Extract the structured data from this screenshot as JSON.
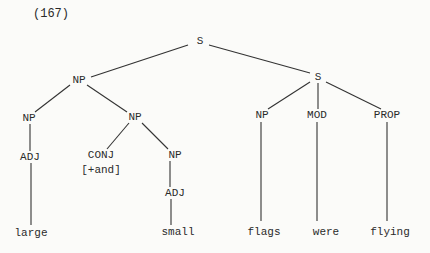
{
  "example_number": "(167)",
  "tree": {
    "nodes": [
      {
        "id": "s_root",
        "label": "S",
        "x": 200,
        "y": 41
      },
      {
        "id": "np_subj",
        "label": "NP",
        "x": 79,
        "y": 80
      },
      {
        "id": "s_pred",
        "label": "S",
        "x": 318,
        "y": 77
      },
      {
        "id": "np_left",
        "label": "NP",
        "x": 29,
        "y": 118
      },
      {
        "id": "np_conj",
        "label": "NP",
        "x": 135,
        "y": 117
      },
      {
        "id": "adj_left",
        "label": "ADJ",
        "x": 30,
        "y": 157
      },
      {
        "id": "conj",
        "label": "CONJ",
        "x": 101,
        "y": 155
      },
      {
        "id": "conj_feature",
        "label": "[+and]",
        "x": 101,
        "y": 170
      },
      {
        "id": "np_inner",
        "label": "NP",
        "x": 175,
        "y": 155
      },
      {
        "id": "adj_inner",
        "label": "ADJ",
        "x": 175,
        "y": 193
      },
      {
        "id": "np_right",
        "label": "NP",
        "x": 262,
        "y": 115
      },
      {
        "id": "mod",
        "label": "MOD",
        "x": 317,
        "y": 115
      },
      {
        "id": "prop",
        "label": "PROP",
        "x": 387,
        "y": 115
      },
      {
        "id": "leaf_large",
        "label": "large",
        "x": 31,
        "y": 233
      },
      {
        "id": "leaf_small",
        "label": "small",
        "x": 178,
        "y": 232
      },
      {
        "id": "leaf_flags",
        "label": "flags",
        "x": 264,
        "y": 232
      },
      {
        "id": "leaf_were",
        "label": "were",
        "x": 326,
        "y": 232
      },
      {
        "id": "leaf_flying",
        "label": "flying",
        "x": 390,
        "y": 232
      }
    ],
    "edges": [
      {
        "x1": 188,
        "y1": 45,
        "x2": 91,
        "y2": 77
      },
      {
        "x1": 209,
        "y1": 45,
        "x2": 310,
        "y2": 73
      },
      {
        "x1": 70,
        "y1": 85,
        "x2": 35,
        "y2": 112
      },
      {
        "x1": 87,
        "y1": 85,
        "x2": 127,
        "y2": 112
      },
      {
        "x1": 310,
        "y1": 82,
        "x2": 268,
        "y2": 109
      },
      {
        "x1": 318,
        "y1": 83,
        "x2": 318,
        "y2": 109
      },
      {
        "x1": 326,
        "y1": 82,
        "x2": 381,
        "y2": 109
      },
      {
        "x1": 30,
        "y1": 124,
        "x2": 30,
        "y2": 151
      },
      {
        "x1": 129,
        "y1": 123,
        "x2": 107,
        "y2": 149
      },
      {
        "x1": 142,
        "y1": 123,
        "x2": 168,
        "y2": 149
      },
      {
        "x1": 170,
        "y1": 161,
        "x2": 170,
        "y2": 187
      },
      {
        "x1": 31,
        "y1": 163,
        "x2": 31,
        "y2": 225
      },
      {
        "x1": 171,
        "y1": 199,
        "x2": 171,
        "y2": 225
      },
      {
        "x1": 261,
        "y1": 122,
        "x2": 261,
        "y2": 221
      },
      {
        "x1": 317,
        "y1": 122,
        "x2": 317,
        "y2": 221
      },
      {
        "x1": 387,
        "y1": 122,
        "x2": 387,
        "y2": 221
      }
    ]
  }
}
